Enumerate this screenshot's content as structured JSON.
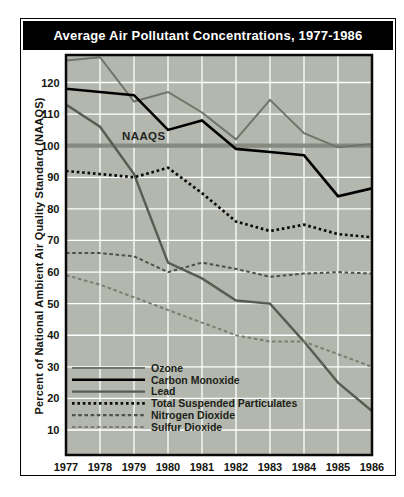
{
  "title": "Average Air Pollutant Concentrations, 1977-1986",
  "colors": {
    "title_bg": "#000000",
    "title_text": "#ffffff",
    "plot_bg": "#b3b7ad",
    "gridline": "#ffffff",
    "plot_border": "#0a0a0a",
    "naaqs_line": "#868a80",
    "axis_text": "#15150f"
  },
  "chart_data": {
    "type": "line",
    "title": "Average Air Pollutant Concentrations, 1977-1986",
    "xlabel": "",
    "ylabel": "Percent of National Ambient Air Quality Standard (NAAQS)",
    "categories": [
      "1977",
      "1978",
      "1979",
      "1980",
      "1981",
      "1982",
      "1983",
      "1984",
      "1985",
      "1986"
    ],
    "ylim": [
      0,
      129
    ],
    "yticks": [
      10,
      20,
      30,
      40,
      50,
      60,
      70,
      80,
      90,
      100,
      110,
      120
    ],
    "grid": true,
    "legend_position": "inside lower-left",
    "reference_line": {
      "label": "NAAQS",
      "value": 100
    },
    "series": [
      {
        "name": "Ozone",
        "color": "#70746a",
        "style": "solid",
        "width": 2,
        "values": [
          127,
          128,
          114,
          117,
          110.5,
          102,
          114.5,
          104,
          99.5,
          100.5
        ]
      },
      {
        "name": "Carbon Monoxide",
        "color": "#000000",
        "style": "solid",
        "width": 2.6,
        "values": [
          118,
          117,
          116,
          105,
          108,
          99,
          98,
          97,
          84,
          86.5
        ]
      },
      {
        "name": "Lead",
        "color": "#585c52",
        "style": "solid",
        "width": 2.4,
        "values": [
          113,
          106,
          91,
          63,
          58,
          51,
          50,
          38,
          25,
          16
        ]
      },
      {
        "name": "Total Suspended Particulates",
        "color": "#0a0a0a",
        "style": "dotted",
        "width": 2.7,
        "values": [
          92,
          91,
          90,
          93,
          85,
          76,
          73,
          75,
          72,
          71
        ]
      },
      {
        "name": "Nitrogen Dioxide",
        "color": "#4e5248",
        "style": "dashed",
        "width": 2,
        "values": [
          66,
          66,
          65,
          60,
          63,
          61,
          58.5,
          59.5,
          60,
          59.5
        ]
      },
      {
        "name": "Sulfur Dioxide",
        "color": "#7b7f73",
        "style": "dashed",
        "width": 2,
        "values": [
          59,
          56,
          52,
          48,
          44,
          40,
          38,
          38,
          34,
          30
        ]
      }
    ]
  }
}
